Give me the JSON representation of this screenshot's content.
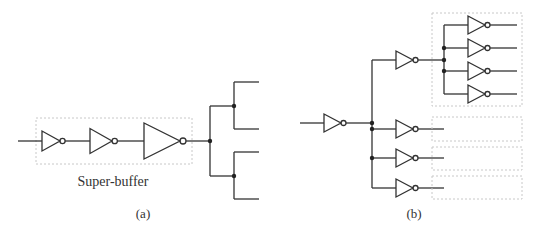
{
  "figure": {
    "panel_a": {
      "caption": "(a)",
      "box_label": "Super-buffer",
      "description": "Chain of three progressively larger inverters (super-buffer) driving a binary fanout tree with four outputs"
    },
    "panel_b": {
      "caption": "(b)",
      "description": "Inverter driving four inverters, each of which drives a group of four inverters (fanout tree); only the top group is drawn, the other three are shown as empty dashed boxes"
    }
  },
  "colors": {
    "wire": "#333333",
    "dashed_box": "#c8c8c8",
    "text": "#333333",
    "background": "#ffffff"
  }
}
